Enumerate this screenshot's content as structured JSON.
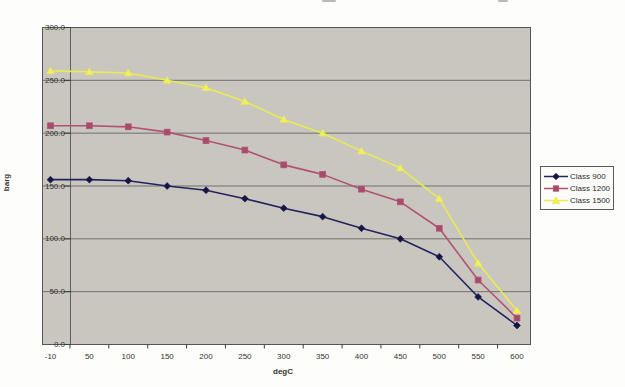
{
  "chart_data": {
    "type": "line",
    "xlabel": "degC",
    "ylabel": "barg",
    "x_categories": [
      "-10",
      "50",
      "100",
      "150",
      "200",
      "250",
      "300",
      "350",
      "400",
      "450",
      "500",
      "550",
      "600"
    ],
    "y_tick_labels": [
      "0.0",
      "50.0",
      "100.0",
      "150.0",
      "200.0",
      "250.0",
      "300.0"
    ],
    "ylim": [
      0,
      300
    ],
    "grid": "horizontal",
    "legend_position": "right",
    "plot_background": "#c9c6bf",
    "gridline_color": "#70706c",
    "series": [
      {
        "name": "Class 900",
        "marker": "diamond",
        "color": "#232360",
        "marker_fill": "#15153e",
        "values": [
          156,
          156,
          155,
          150,
          146,
          138,
          129,
          121,
          110,
          100,
          83,
          45,
          18
        ]
      },
      {
        "name": "Class 1200",
        "marker": "square",
        "color": "#b25273",
        "marker_fill": "#a84a6e",
        "values": [
          207,
          207,
          206,
          201,
          193,
          184,
          170,
          161,
          147,
          135,
          110,
          61,
          25
        ]
      },
      {
        "name": "Class 1500",
        "marker": "triangle",
        "color": "#eaea55",
        "marker_fill": "#f0f060",
        "values": [
          259,
          258,
          257,
          250,
          243,
          230,
          213,
          200,
          183,
          167,
          138,
          77,
          32
        ]
      }
    ]
  }
}
